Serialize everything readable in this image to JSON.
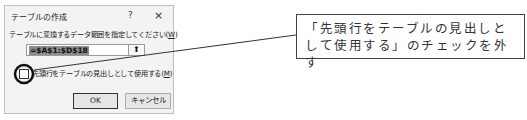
{
  "dialog": {
    "title": "テーブルの作成",
    "help_label": "?",
    "close_label": "×",
    "prompt_text": "テーブルに変換するデータ範囲を指定してください(",
    "prompt_accesskey": "W",
    "prompt_suffix": ")",
    "range_value": "=$A$1:$D$18",
    "collapse_icon": "⬆",
    "checkbox": {
      "checked": false,
      "label_text": "先頭行をテーブルの見出しとして使用する(",
      "label_accesskey": "M",
      "label_suffix": ")"
    },
    "ok_label": "OK",
    "cancel_label": "キャンセル"
  },
  "annotation": {
    "callout_text": "「先頭行をテーブルの見出しとして使用する」のチェックを外す",
    "line_color": "#333333",
    "circle_color": "#111111"
  }
}
